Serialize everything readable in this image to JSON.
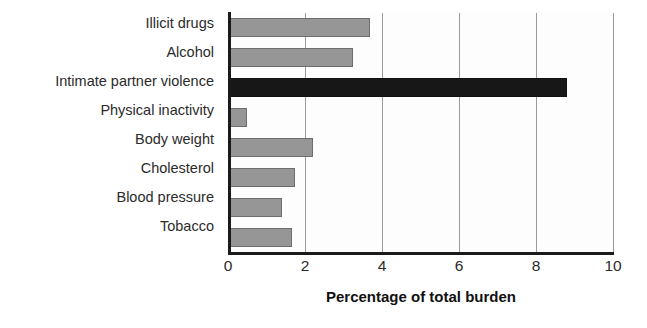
{
  "chart_data": {
    "type": "bar",
    "orientation": "horizontal",
    "title": "",
    "xlabel": "Percentage of total burden",
    "ylabel": "",
    "categories": [
      "Illicit drugs",
      "Alcohol",
      "Intimate partner violence",
      "Physical inactivity",
      "Body weight",
      "Cholesterol",
      "Blood pressure",
      "Tobacco"
    ],
    "values": [
      3.7,
      3.25,
      8.8,
      0.5,
      2.2,
      1.75,
      1.4,
      1.65
    ],
    "highlight_category": "Intimate partner violence",
    "xlim": [
      0,
      10
    ],
    "xticks": [
      0,
      2,
      4,
      6,
      8,
      10
    ],
    "xtick_labels": [
      "0",
      "2",
      "4",
      "6",
      "8",
      "10"
    ],
    "grid": "vertical",
    "legend": "none",
    "colors": {
      "bar_fill": "#969696",
      "bar_stroke": "#6e6e6e",
      "highlight_fill": "#171717",
      "highlight_stroke": "#111111",
      "gridline": "#9a9a9a",
      "axis": "#1a1a1a",
      "text": "#2b2b2b",
      "background": "#ffffff"
    }
  }
}
